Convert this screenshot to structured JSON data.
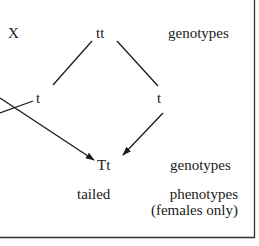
{
  "diagram": {
    "cross_symbol": "X",
    "parent_genotype": "tt",
    "gamete_left": "t",
    "gamete_right": "t",
    "offspring_genotype": "Tt",
    "offspring_phenotype": "tailed",
    "row_labels": {
      "parent_genotypes": "genotypes",
      "offspring_genotypes": "genotypes",
      "phenotypes": "phenotypes",
      "phenotypes_note": "(females only)"
    },
    "colors": {
      "ink": "#1a1a1a",
      "border": "#333333",
      "background": "#ffffff"
    }
  }
}
